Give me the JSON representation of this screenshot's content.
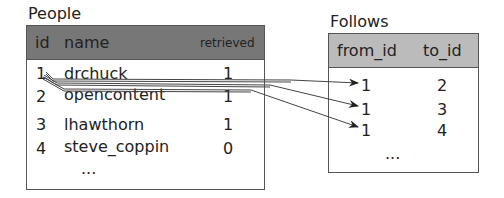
{
  "people": {
    "title": "People",
    "header_color": "#777777",
    "columns": [
      "id",
      "name",
      "retrieved"
    ],
    "rows": [
      {
        "id": "1",
        "name": "drchuck",
        "retrieved": "1"
      },
      {
        "id": "2",
        "name": "opencontent",
        "retrieved": "1"
      },
      {
        "id": "3",
        "name": "lhawthorn",
        "retrieved": "1"
      },
      {
        "id": "4",
        "name": "steve_coppin",
        "retrieved": "0"
      }
    ],
    "ellipsis": "..."
  },
  "follows": {
    "title": "Follows",
    "header_color": "#bbbbbb",
    "columns": [
      "from_id",
      "to_id"
    ],
    "rows": [
      {
        "from_id": "1",
        "to_id": "2"
      },
      {
        "from_id": "1",
        "to_id": "3"
      },
      {
        "from_id": "1",
        "to_id": "4"
      }
    ],
    "ellipsis": "..."
  },
  "arrows": [
    {
      "from": "people.rows.0.id",
      "to": "follows.rows.0.from_id"
    },
    {
      "from": "people.rows.0.id",
      "to": "follows.rows.1.from_id"
    },
    {
      "from": "people.rows.0.id",
      "to": "follows.rows.2.from_id"
    }
  ]
}
